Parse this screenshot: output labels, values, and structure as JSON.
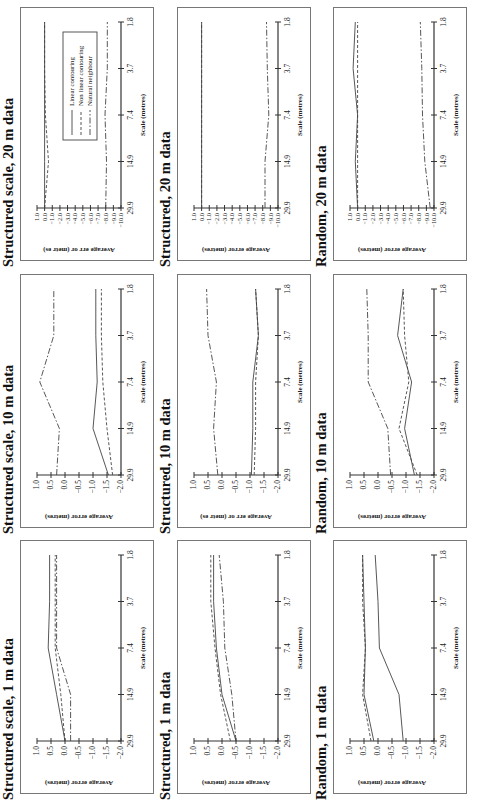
{
  "figure": {
    "orientation": "rotated-90-ccw",
    "legend": {
      "panel_index": 0,
      "entries": [
        {
          "label": "Linear contouring",
          "style": "solid"
        },
        {
          "label": "Non linear contouring",
          "style": "dashed"
        },
        {
          "label": "Natural neighbour",
          "style": "dashdot"
        }
      ]
    }
  },
  "chart_data": [
    {
      "type": "line",
      "title": "Structured scale, 20 m data",
      "xlabel": "Scale (metres)",
      "ylabel": "Average err or (metr es)",
      "x": [
        29.9,
        14.9,
        7.4,
        3.7,
        1.8
      ],
      "xticks": [
        "29.9",
        "14.9",
        "7.4",
        "3.7",
        "1.8"
      ],
      "ylim": [
        -10.0,
        1.0
      ],
      "yticks": [
        "1.0",
        "0.0",
        "-1.0",
        "-2.0",
        "-3.0",
        "-4.0",
        "-5.0",
        "-6.0",
        "-7.0",
        "-8.0",
        "-9.0",
        "-10.0"
      ],
      "legend": [
        "Linear contouring",
        "Non linear contouring",
        "Natural neighbour"
      ],
      "series": [
        {
          "name": "Linear contouring",
          "style": "solid",
          "values": [
            0.0,
            0.0,
            0.0,
            0.0,
            0.0
          ]
        },
        {
          "name": "Non linear contouring",
          "style": "dashed",
          "values": [
            0.0,
            -0.5,
            -0.1,
            0.0,
            0.0
          ]
        },
        {
          "name": "Natural neighbour",
          "style": "dashdot",
          "values": [
            -8.0,
            -8.1,
            -7.9,
            -8.2,
            -8.2
          ]
        }
      ]
    },
    {
      "type": "line",
      "title": "Structured scale, 10 m data",
      "xlabel": "Scale (metres)",
      "ylabel": "Average error (metres)",
      "x": [
        29.9,
        14.9,
        7.4,
        3.7,
        1.8
      ],
      "xticks": [
        "29.9",
        "14.9",
        "7.4",
        "3.7",
        "1.8"
      ],
      "ylim": [
        -2.0,
        1.0
      ],
      "yticks": [
        "1.0",
        "0.5",
        "0.0",
        "-0.5",
        "-1.0",
        "-1.5",
        "-2.0"
      ],
      "series": [
        {
          "name": "Linear contouring",
          "style": "solid",
          "values": [
            -1.55,
            -1.0,
            -1.15,
            -1.1,
            -1.1
          ]
        },
        {
          "name": "Non linear contouring",
          "style": "dashed",
          "values": [
            -1.7,
            -1.5,
            -1.35,
            -1.3,
            -1.3
          ]
        },
        {
          "name": "Natural neighbour",
          "style": "dashdot",
          "values": [
            0.3,
            0.2,
            0.9,
            0.4,
            0.4
          ]
        }
      ]
    },
    {
      "type": "line",
      "title": "Structured scale, 1 m data",
      "xlabel": "Scale (metres)",
      "ylabel": "Average error (metres)",
      "x": [
        29.9,
        14.9,
        7.4,
        3.7,
        1.8
      ],
      "xticks": [
        "29.9",
        "14.9",
        "7.4",
        "3.7",
        "1.8"
      ],
      "ylim": [
        -2.0,
        1.0
      ],
      "yticks": [
        "1.0",
        "0.5",
        "0.0",
        "-0.5",
        "-1.0",
        "-1.5",
        "-2.0"
      ],
      "series": [
        {
          "name": "Linear contouring",
          "style": "solid",
          "values": [
            0.0,
            0.3,
            0.6,
            0.55,
            0.55
          ]
        },
        {
          "name": "Non linear contouring",
          "style": "dashed",
          "values": [
            0.0,
            0.15,
            0.35,
            0.35,
            0.35
          ]
        },
        {
          "name": "Natural neighbour",
          "style": "dashdot",
          "values": [
            -0.2,
            -0.2,
            0.3,
            0.3,
            0.3
          ]
        }
      ]
    },
    {
      "type": "line",
      "title": "Structured, 20 m data",
      "xlabel": "Scale (metres)",
      "ylabel": "Average error (metres)",
      "x": [
        29.9,
        14.9,
        7.4,
        3.7,
        1.8
      ],
      "xticks": [
        "29.9",
        "14.9",
        "7.4",
        "3.7",
        "1.8"
      ],
      "ylim": [
        -10.0,
        1.0
      ],
      "yticks": [
        "1.0",
        "0.0",
        "-1.0",
        "-2.0",
        "-3.0",
        "-4.0",
        "-5.0",
        "-6.0",
        "-7.0",
        "-8.0",
        "-9.0",
        "-10.0"
      ],
      "series": [
        {
          "name": "Linear contouring",
          "style": "solid",
          "values": [
            0.0,
            0.0,
            0.0,
            0.0,
            0.0
          ]
        },
        {
          "name": "Non linear contouring",
          "style": "dashed",
          "values": [
            0.0,
            0.0,
            0.0,
            0.0,
            0.0
          ]
        },
        {
          "name": "Natural neighbour",
          "style": "dashdot",
          "values": [
            -8.3,
            -8.3,
            -8.8,
            -8.6,
            -8.5
          ]
        }
      ]
    },
    {
      "type": "line",
      "title": "Structured, 10 m data",
      "xlabel": "Scale (metres)",
      "ylabel": "Average err or (metr es)",
      "x": [
        29.9,
        14.9,
        7.4,
        3.7,
        1.8
      ],
      "xticks": [
        "29.9",
        "14.9",
        "7.4",
        "3.7",
        "1.8"
      ],
      "ylim": [
        -2.0,
        1.0
      ],
      "yticks": [
        "1.0",
        "0.5",
        "0.0",
        "-0.5",
        "-1.0",
        "-1.5",
        "-2.0"
      ],
      "series": [
        {
          "name": "Linear contouring",
          "style": "solid",
          "values": [
            -1.05,
            -1.1,
            -1.1,
            -1.3,
            -1.2
          ]
        },
        {
          "name": "Non linear contouring",
          "style": "dashed",
          "values": [
            -1.15,
            -1.2,
            -1.2,
            -1.3,
            -1.2
          ]
        },
        {
          "name": "Natural neighbour",
          "style": "dashdot",
          "values": [
            0.15,
            0.3,
            0.2,
            0.5,
            0.55
          ]
        }
      ]
    },
    {
      "type": "line",
      "title": "Structured, 1 m data",
      "xlabel": "Scale (metres)",
      "ylabel": "Average error (metres)",
      "x": [
        29.9,
        14.9,
        7.4,
        3.7,
        1.8
      ],
      "xticks": [
        "29.9",
        "14.9",
        "7.4",
        "3.7",
        "1.8"
      ],
      "ylim": [
        -2.0,
        1.0
      ],
      "yticks": [
        "1.0",
        "0.5",
        "0.0",
        "-0.5",
        "-1.0",
        "-1.5",
        "-2.0"
      ],
      "series": [
        {
          "name": "Linear contouring",
          "style": "solid",
          "values": [
            -0.5,
            0.0,
            0.2,
            0.3,
            0.3
          ]
        },
        {
          "name": "Non linear contouring",
          "style": "dashed",
          "values": [
            -0.3,
            0.05,
            0.25,
            0.4,
            0.4
          ]
        },
        {
          "name": "Natural neighbour",
          "style": "dashdot",
          "values": [
            -0.5,
            -0.35,
            -0.1,
            -0.05,
            0.1
          ]
        }
      ]
    },
    {
      "type": "line",
      "title": "Random, 20 m data",
      "xlabel": "Scale (metres)",
      "ylabel": "Average error (metres)",
      "x": [
        29.9,
        14.9,
        7.4,
        3.7,
        1.8
      ],
      "xticks": [
        "29.9",
        "14.9",
        "7.4",
        "3.7",
        "1.8"
      ],
      "ylim": [
        -10.0,
        1.0
      ],
      "yticks": [
        "1.0",
        "0.0",
        "-1.0",
        "-2.0",
        "-3.0",
        "-4.0",
        "-5.0",
        "-6.0",
        "-7.0",
        "-8.0",
        "-9.0",
        "-10.0"
      ],
      "series": [
        {
          "name": "Linear contouring",
          "style": "solid",
          "values": [
            0.0,
            0.3,
            0.0,
            0.6,
            0.3
          ]
        },
        {
          "name": "Non linear contouring",
          "style": "dashed",
          "values": [
            0.0,
            0.0,
            0.0,
            0.0,
            0.0
          ]
        },
        {
          "name": "Natural neighbour",
          "style": "dashdot",
          "values": [
            -9.5,
            -8.8,
            -8.5,
            -8.4,
            -8.2
          ]
        }
      ]
    },
    {
      "type": "line",
      "title": "Random, 10 m data",
      "xlabel": "Scale (metres)",
      "ylabel": "Average error (metres)",
      "x": [
        29.9,
        14.9,
        7.4,
        3.7,
        1.8
      ],
      "xticks": [
        "29.9",
        "14.9",
        "7.4",
        "3.7",
        "1.8"
      ],
      "ylim": [
        -2.0,
        1.0
      ],
      "yticks": [
        "1.0",
        "0.5",
        "0.0",
        "-0.5",
        "-1.0",
        "-1.5",
        "-2.0"
      ],
      "series": [
        {
          "name": "Linear contouring",
          "style": "solid",
          "values": [
            -1.3,
            -0.95,
            -1.2,
            -0.7,
            -0.9
          ]
        },
        {
          "name": "Non linear contouring",
          "style": "dashed",
          "values": [
            -1.4,
            -0.75,
            -1.1,
            -0.95,
            -0.9
          ]
        },
        {
          "name": "Natural neighbour",
          "style": "dashdot",
          "values": [
            -0.45,
            -0.35,
            0.35,
            0.35,
            0.4
          ]
        }
      ]
    },
    {
      "type": "line",
      "title": "Random, 1 m data",
      "xlabel": "Scale (metres)",
      "ylabel": "Average error (metres)",
      "x": [
        29.9,
        14.9,
        7.4,
        3.7,
        1.8
      ],
      "xticks": [
        "29.9",
        "14.9",
        "7.4",
        "3.7",
        "1.8"
      ],
      "ylim": [
        -2.0,
        1.0
      ],
      "yticks": [
        "1.0",
        "0.5",
        "0.0",
        "-0.5",
        "-1.0",
        "-1.5",
        "-2.0"
      ],
      "series": [
        {
          "name": "Linear contouring",
          "style": "solid",
          "values": [
            0.15,
            0.5,
            0.45,
            0.5,
            0.55
          ]
        },
        {
          "name": "Non linear contouring",
          "style": "dashed",
          "values": [
            0.25,
            0.55,
            0.45,
            0.55,
            0.55
          ]
        },
        {
          "name": "Natural neighbour",
          "style": "solid",
          "values": [
            -0.9,
            -0.75,
            -0.05,
            0.0,
            0.1
          ]
        }
      ]
    }
  ]
}
